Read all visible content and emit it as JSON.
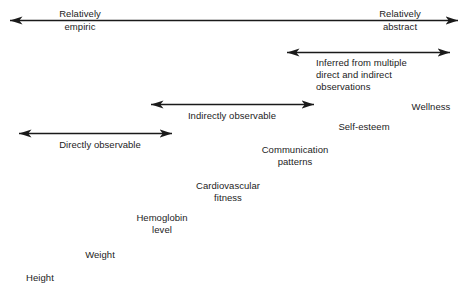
{
  "diagram": {
    "background_color": "#ffffff",
    "line_color": "#1a1a1a",
    "text_color": "#1c1c1c",
    "axes": [
      {
        "id": "empiric-abstract",
        "label_left_line1": "Relatively",
        "label_left_line2": "empiric",
        "label_right_line1": "Relatively",
        "label_right_line2": "abstract",
        "direction": "both"
      },
      {
        "id": "inferred",
        "label_line1": "Inferred from multiple",
        "label_line2": "direct and indirect",
        "label_line3": "observations",
        "direction": "both"
      },
      {
        "id": "indirectly-observable",
        "label": "Indirectly observable",
        "direction": "both"
      },
      {
        "id": "directly-observable",
        "label": "Directly observable",
        "direction": "both"
      }
    ],
    "items": [
      {
        "id": "wellness",
        "label": "Wellness"
      },
      {
        "id": "self-esteem",
        "label": "Self-esteem"
      },
      {
        "id": "communication-patterns",
        "label_line1": "Communication",
        "label_line2": "patterns"
      },
      {
        "id": "cardiovascular-fitness",
        "label_line1": "Cardiovascular",
        "label_line2": "fitness"
      },
      {
        "id": "hemoglobin-level",
        "label_line1": "Hemoglobin",
        "label_line2": "level"
      },
      {
        "id": "weight",
        "label": "Weight"
      },
      {
        "id": "height",
        "label": "Height"
      }
    ]
  }
}
